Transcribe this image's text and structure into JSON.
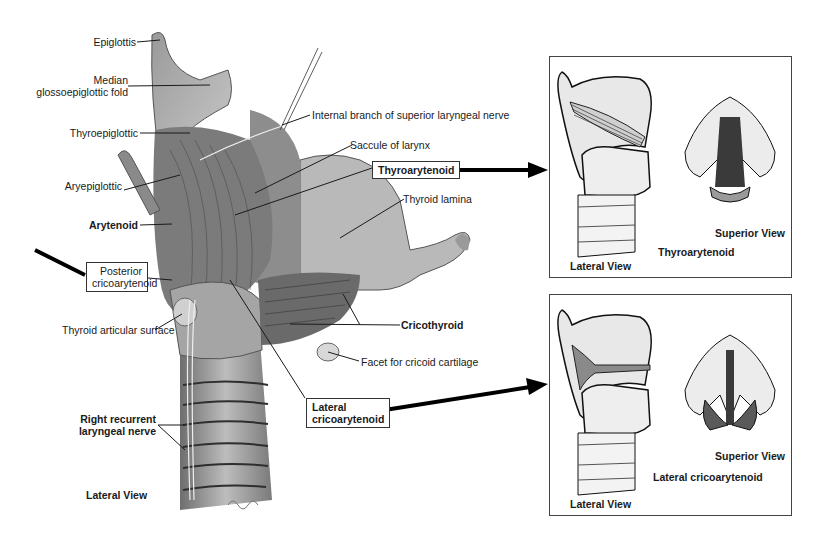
{
  "figure": {
    "main_view_caption": "Lateral View",
    "labels": {
      "epiglottis": "Epiglottis",
      "median_fold_line1": "Median",
      "median_fold_line2": "glossoepiglottic fold",
      "thyroepiglottic": "Thyroepiglottic",
      "aryepiglottic": "Aryepiglottic",
      "arytenoid": "Arytenoid",
      "posterior_line1": "Posterior",
      "posterior_line2": "cricoarytenoid",
      "thyroid_articular": "Thyroid articular surface",
      "right_recurrent_line1": "Right recurrent",
      "right_recurrent_line2": "laryngeal nerve",
      "internal_branch": "Internal branch of superior laryngeal nerve",
      "saccule": "Saccule of larynx",
      "thyroarytenoid": "Thyroarytenoid",
      "thyroid_lamina": "Thyroid lamina",
      "cricothyroid": "Cricothyroid",
      "facet": "Facet for cricoid cartilage",
      "lateral_crico_line1": "Lateral",
      "lateral_crico_line2": "cricoarytenoid"
    },
    "panels": [
      {
        "lateral_caption": "Lateral View",
        "superior_caption": "Superior View",
        "muscle_caption": "Thyroarytenoid"
      },
      {
        "lateral_caption": "Lateral View",
        "superior_caption": "Superior View",
        "muscle_caption": "Lateral cricoarytenoid"
      }
    ],
    "colors": {
      "ink": "#1a1a1a",
      "tissue_light": "#d9d9d9",
      "tissue_mid": "#a6a6a6",
      "tissue_dark": "#5a5a5a",
      "muscle_dark": "#3a3a3a"
    }
  }
}
